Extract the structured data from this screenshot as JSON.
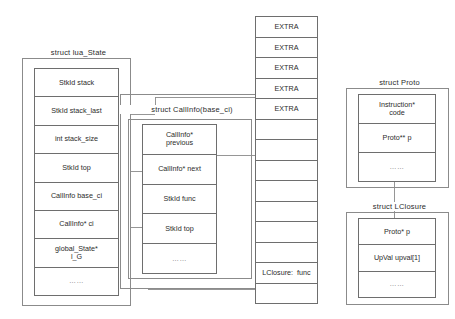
{
  "diagram": {
    "title_lua_state": "struct lua_State",
    "title_callinfo": "struct CallInfo(base_ci)",
    "title_proto": "struct Proto",
    "title_lclosure": "struct LClosure",
    "ellipsis": "……",
    "line_color": "#8b8b8b",
    "box_color": "#6e6e6e",
    "text_color": "#2b2b2b"
  },
  "lua_state": {
    "fields": [
      {
        "label": "StkId stack"
      },
      {
        "label": "StkId stack_last"
      },
      {
        "label": "int stack_size"
      },
      {
        "label": "StkId top"
      },
      {
        "label": "CallInfo base_ci"
      },
      {
        "label": "CallInfo* ci"
      },
      {
        "label": "global_State*\nl_G"
      },
      {
        "label": "……"
      }
    ]
  },
  "callinfo": {
    "fields": [
      {
        "label": "CallInfo*\nprevious"
      },
      {
        "label": "CallInfo* next"
      },
      {
        "label": "StkId func"
      },
      {
        "label": "StkId top"
      },
      {
        "label": "……"
      }
    ]
  },
  "proto": {
    "fields": [
      {
        "label": "Instruction*\ncode"
      },
      {
        "label": "Proto** p"
      },
      {
        "label": "……"
      }
    ]
  },
  "lclosure": {
    "fields": [
      {
        "label": "Proto* p"
      },
      {
        "label": "UpVal upval[1]"
      },
      {
        "label": "……"
      }
    ]
  },
  "stack": {
    "cells": [
      {
        "label": "EXTRA"
      },
      {
        "label": "EXTRA"
      },
      {
        "label": "EXTRA"
      },
      {
        "label": "EXTRA"
      },
      {
        "label": "EXTRA"
      },
      {
        "label": ""
      },
      {
        "label": ""
      },
      {
        "label": ""
      },
      {
        "label": ""
      },
      {
        "label": ""
      },
      {
        "label": ""
      },
      {
        "label": ""
      },
      {
        "label": "LClosure:  func"
      },
      {
        "label": ""
      }
    ]
  }
}
